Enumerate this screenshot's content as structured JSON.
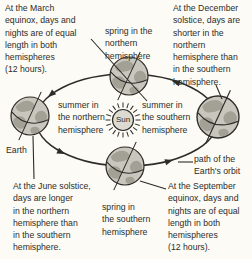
{
  "colors": {
    "paper": "#fcfbf6",
    "ink": "#2e2c28",
    "ocean": "#c9c7bd",
    "land": "#a3a196",
    "sun": "#dcdad1"
  },
  "labels": {
    "march": [
      "At the March",
      "equinox, days and",
      "nights are of equal",
      "length in both",
      "hemispheres",
      "(12 hours)."
    ],
    "spring_north": [
      "spring in the",
      "northern",
      "hemisphere"
    ],
    "december": [
      "At the December",
      "solstice, days are",
      "shorter in the",
      "northern",
      "hemisphere than",
      "in the southern",
      "hemisphere."
    ],
    "summer_north": [
      "summer in",
      "the northern",
      "hemisphere"
    ],
    "sun": "Sun",
    "summer_south": [
      "summer in",
      "the southern",
      "hemisphere"
    ],
    "earth": "Earth",
    "june": [
      "At the June solstice,",
      "days are longer",
      "in the northern",
      "hemisphere than",
      "in the southern",
      "hemisphere."
    ],
    "spring_south": [
      "spring in",
      "the southern",
      "hemisphere"
    ],
    "orbit_path": [
      "path of the",
      "Earth's orbit"
    ],
    "september": [
      "At the September",
      "equinox, days and",
      "nights are of equal",
      "length in both",
      "hemispheres",
      "(12 hours)."
    ]
  }
}
